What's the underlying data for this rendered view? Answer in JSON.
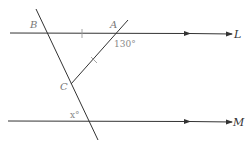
{
  "diagram": {
    "colors": {
      "line": "#333333",
      "label": "#777777",
      "tick": "#999999",
      "background": "#ffffff"
    },
    "lines": {
      "L": {
        "label": "L",
        "parallel": true
      },
      "M": {
        "label": "M",
        "parallel": true
      }
    },
    "points": {
      "A": {
        "label": "A"
      },
      "B": {
        "label": "B"
      },
      "C": {
        "label": "C"
      }
    },
    "angles": {
      "at_A": {
        "label": "130°"
      },
      "at_M": {
        "label": "x°"
      }
    },
    "tick_marks": [
      "BA equal tick",
      "AC equal tick"
    ]
  }
}
